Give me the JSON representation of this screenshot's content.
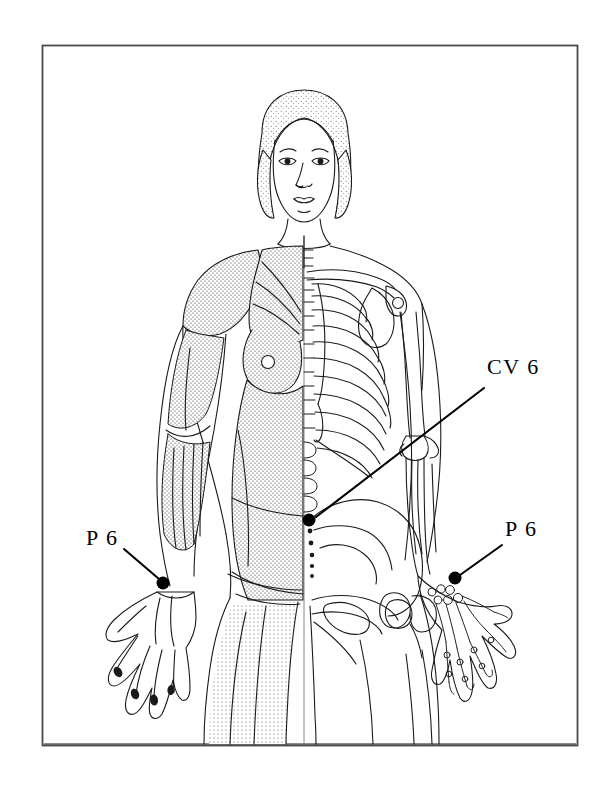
{
  "figure": {
    "kind": "anatomical-illustration",
    "border": {
      "color": "#444444",
      "x": 42,
      "y": 45,
      "width": 535,
      "height": 700
    },
    "ink_color": "#1a1a1a",
    "background_color": "#ffffff"
  },
  "annotations": [
    {
      "id": "cv6",
      "label": "CV 6",
      "text_x": 487,
      "text_y": 356,
      "leader": {
        "x1": 484,
        "y1": 388,
        "x2": 316,
        "y2": 517
      },
      "marker": {
        "x": 309,
        "y": 520,
        "r": 6.5,
        "color": "#000000"
      },
      "region": "lower-abdomen-midline"
    },
    {
      "id": "p6-left",
      "label": "P 6",
      "text_x": 86,
      "text_y": 527,
      "leader": {
        "x1": 124,
        "y1": 549,
        "x2": 159,
        "y2": 579
      },
      "marker": {
        "x": 163,
        "y": 583,
        "r": 6.5,
        "color": "#000000"
      },
      "region": "left-inner-wrist"
    },
    {
      "id": "p6-right",
      "label": "P 6",
      "text_x": 505,
      "text_y": 518,
      "leader": {
        "x1": 502,
        "y1": 545,
        "x2": 460,
        "y2": 575
      },
      "marker": {
        "x": 455,
        "y": 578,
        "r": 6.5,
        "color": "#000000"
      },
      "region": "right-inner-wrist"
    }
  ],
  "anatomy_regions": [
    {
      "name": "head",
      "rendering": "outline-with-stippled-hair"
    },
    {
      "name": "left-torso",
      "rendering": "stippled-musculature"
    },
    {
      "name": "right-torso",
      "rendering": "ribcage-skeleton"
    },
    {
      "name": "spine",
      "rendering": "vertebral-column-midline"
    },
    {
      "name": "left-arm",
      "rendering": "stippled-musculature"
    },
    {
      "name": "right-arm",
      "rendering": "bone-outline"
    },
    {
      "name": "left-hand",
      "rendering": "tendon-outline"
    },
    {
      "name": "right-hand",
      "rendering": "hand-skeleton"
    },
    {
      "name": "pelvis",
      "rendering": "pelvic-bone-right-half"
    },
    {
      "name": "left-leg",
      "rendering": "stippled-musculature"
    },
    {
      "name": "right-leg",
      "rendering": "femur-bone-outline"
    }
  ]
}
